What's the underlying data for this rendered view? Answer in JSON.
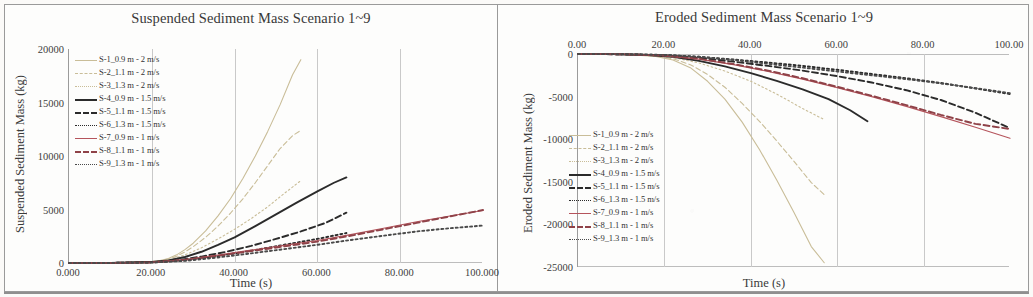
{
  "figure": {
    "panels": [
      "suspended",
      "eroded"
    ]
  },
  "colors": {
    "tan": "#c9bd98",
    "black": "#2b2b2b",
    "red": "#b5545c",
    "grid": "#c9c9c9",
    "axis": "#9b9b9b",
    "text": "#3a3a3a"
  },
  "legend_series": [
    {
      "key": "S-1",
      "label": "S-1_0.9 m - 2 m/s",
      "color": "#c9bd98",
      "style": "solid",
      "weight": "thin"
    },
    {
      "key": "S-2",
      "label": "S-2_1.1 m - 2 m/s",
      "color": "#c9bd98",
      "style": "dash",
      "weight": "thin"
    },
    {
      "key": "S-3",
      "label": "S-3_1.3 m - 2 m/s",
      "color": "#c9bd98",
      "style": "dot",
      "weight": "thin"
    },
    {
      "key": "S-4",
      "label": "S-4_0.9 m - 1.5 m/s",
      "color": "#2b2b2b",
      "style": "solid",
      "weight": "thick"
    },
    {
      "key": "S-5",
      "label": "S-5_1.1 m - 1.5 m/s",
      "color": "#2b2b2b",
      "style": "dash",
      "weight": "thick"
    },
    {
      "key": "S-6",
      "label": "S-6_1.3 m - 1.5 m/s",
      "color": "#2b2b2b",
      "style": "dot",
      "weight": "thick"
    },
    {
      "key": "S-7",
      "label": "S-7_0.9 m - 1 m/s",
      "color": "#b5545c",
      "style": "solid",
      "weight": "thin"
    },
    {
      "key": "S-8",
      "label": "S-8_1.1 m - 1 m/s",
      "color": "#8f4248",
      "style": "dash",
      "weight": "thick"
    },
    {
      "key": "S-9",
      "label": "S-9_1.3 m - 1 m/s",
      "color": "#4a4a4a",
      "style": "dot",
      "weight": "thick"
    }
  ],
  "chart_data": [
    {
      "id": "suspended",
      "type": "line",
      "title": "Suspended Sediment Mass Scenario 1~9",
      "xlabel": "Time (s)",
      "ylabel": "Suspended Sediment Mass (kg)",
      "xlim": [
        0,
        100
      ],
      "ylim": [
        0,
        20000
      ],
      "xticks": [
        0,
        20,
        40,
        60,
        80,
        100
      ],
      "xticklabels": [
        "0.000",
        "20.000",
        "40.000",
        "60.000",
        "80.000",
        "100.000"
      ],
      "yticks": [
        0,
        5000,
        10000,
        15000,
        20000
      ],
      "yticklabels": [
        "0",
        "5000",
        "10000",
        "15000",
        "20000"
      ],
      "grid": "vertical",
      "xaxis_position": "bottom",
      "legend_position": "top-left-inside",
      "series": [
        {
          "name": "S-1_0.9 m - 2 m/s",
          "x": [
            0,
            5,
            10,
            15,
            20,
            22,
            24,
            26,
            28,
            30,
            33,
            36,
            39,
            42,
            45,
            48,
            51,
            54,
            56
          ],
          "y": [
            0,
            10,
            30,
            70,
            140,
            230,
            420,
            760,
            1250,
            1850,
            3000,
            4400,
            6000,
            7900,
            10000,
            12300,
            14800,
            17600,
            19000
          ]
        },
        {
          "name": "S-2_1.1 m - 2 m/s",
          "x": [
            0,
            5,
            10,
            15,
            20,
            22,
            24,
            26,
            28,
            30,
            33,
            36,
            39,
            42,
            45,
            48,
            51,
            54,
            56
          ],
          "y": [
            0,
            8,
            25,
            60,
            120,
            200,
            360,
            640,
            1040,
            1520,
            2400,
            3450,
            4650,
            6000,
            7500,
            9100,
            10700,
            11900,
            12400
          ]
        },
        {
          "name": "S-3_1.3 m - 2 m/s",
          "x": [
            0,
            5,
            10,
            15,
            20,
            24,
            28,
            32,
            36,
            40,
            44,
            48,
            52,
            56
          ],
          "y": [
            0,
            6,
            20,
            48,
            100,
            280,
            760,
            1420,
            2250,
            3150,
            4150,
            5250,
            6500,
            7700
          ]
        },
        {
          "name": "S-4_0.9 m - 1.5 m/s",
          "x": [
            0,
            5,
            10,
            15,
            20,
            24,
            28,
            32,
            36,
            40,
            45,
            50,
            55,
            60,
            64,
            67
          ],
          "y": [
            0,
            5,
            15,
            40,
            90,
            230,
            560,
            1050,
            1700,
            2400,
            3450,
            4550,
            5650,
            6700,
            7500,
            8000
          ]
        },
        {
          "name": "S-5_1.1 m - 1.5 m/s",
          "x": [
            0,
            10,
            20,
            26,
            32,
            38,
            44,
            50,
            56,
            62,
            67
          ],
          "y": [
            0,
            12,
            70,
            240,
            600,
            1050,
            1600,
            2250,
            2950,
            3750,
            4700
          ]
        },
        {
          "name": "S-6_1.3 m - 1.5 m/s",
          "x": [
            0,
            10,
            20,
            28,
            36,
            44,
            52,
            60,
            67
          ],
          "y": [
            0,
            10,
            55,
            250,
            650,
            1150,
            1700,
            2250,
            2800
          ]
        },
        {
          "name": "S-7_0.9 m - 1 m/s",
          "x": [
            0,
            10,
            20,
            28,
            36,
            44,
            52,
            60,
            68,
            76,
            84,
            92,
            100
          ],
          "y": [
            0,
            10,
            60,
            330,
            750,
            1200,
            1650,
            2100,
            2650,
            3250,
            3850,
            4400,
            4900
          ]
        },
        {
          "name": "S-8_1.1 m - 1 m/s",
          "x": [
            0,
            10,
            20,
            28,
            36,
            44,
            52,
            60,
            68,
            76,
            84,
            92,
            100
          ],
          "y": [
            0,
            9,
            55,
            290,
            680,
            1120,
            1550,
            2000,
            2550,
            3150,
            3750,
            4350,
            4950
          ]
        },
        {
          "name": "S-9_1.3 m - 1 m/s",
          "x": [
            0,
            10,
            20,
            28,
            36,
            44,
            52,
            60,
            68,
            76,
            84,
            92,
            100
          ],
          "y": [
            0,
            7,
            40,
            200,
            520,
            900,
            1300,
            1700,
            2150,
            2550,
            2950,
            3250,
            3500
          ]
        }
      ]
    },
    {
      "id": "eroded",
      "type": "line",
      "title": "Eroded Sediment Mass Scenario 1~9",
      "xlabel": "Time (s)",
      "ylabel": "Eroded Sediment Mass (kg)",
      "xlim": [
        0,
        100
      ],
      "ylim": [
        -25000,
        0
      ],
      "xticks": [
        0,
        20,
        40,
        60,
        80,
        100
      ],
      "xticklabels": [
        "0.00",
        "20.00",
        "40.00",
        "60.00",
        "80.00",
        "100.00"
      ],
      "yticks": [
        0,
        -5000,
        -10000,
        -15000,
        -20000,
        -25000
      ],
      "yticklabels": [
        "0",
        "-5000",
        "-10000",
        "-15000",
        "-20000",
        "-25000"
      ],
      "grid": "vertical",
      "xaxis_position": "top",
      "legend_position": "lower-left-inside",
      "series": [
        {
          "name": "S-1_0.9 m - 2 m/s",
          "x": [
            0,
            6,
            12,
            18,
            22,
            26,
            30,
            34,
            38,
            42,
            46,
            50,
            54,
            57
          ],
          "y": [
            0,
            -20,
            -80,
            -300,
            -700,
            -1600,
            -3200,
            -5300,
            -8000,
            -11200,
            -14800,
            -18600,
            -22600,
            -24500
          ]
        },
        {
          "name": "S-2_1.1 m - 2 m/s",
          "x": [
            0,
            6,
            12,
            18,
            22,
            26,
            30,
            34,
            38,
            42,
            46,
            50,
            54,
            57
          ],
          "y": [
            0,
            -15,
            -60,
            -230,
            -560,
            -1250,
            -2400,
            -3900,
            -5800,
            -7900,
            -10200,
            -12600,
            -15100,
            -16500
          ]
        },
        {
          "name": "S-3_1.3 m - 2 m/s",
          "x": [
            0,
            8,
            16,
            22,
            28,
            34,
            40,
            46,
            52,
            57
          ],
          "y": [
            0,
            -25,
            -130,
            -420,
            -1050,
            -2000,
            -3200,
            -4700,
            -6400,
            -7700
          ]
        },
        {
          "name": "S-4_0.9 m - 1.5 m/s",
          "x": [
            0,
            8,
            16,
            22,
            28,
            34,
            40,
            46,
            52,
            58,
            63,
            67
          ],
          "y": [
            0,
            -20,
            -110,
            -330,
            -800,
            -1450,
            -2250,
            -3150,
            -4150,
            -5300,
            -6600,
            -7900
          ]
        },
        {
          "name": "S-5_1.1 m - 1.5 m/s",
          "x": [
            0,
            10,
            20,
            28,
            36,
            44,
            52,
            60,
            68,
            76,
            84,
            92,
            100
          ],
          "y": [
            0,
            -30,
            -150,
            -450,
            -900,
            -1400,
            -1950,
            -2600,
            -3350,
            -4250,
            -5400,
            -6900,
            -8700
          ]
        },
        {
          "name": "S-6_1.3 m - 1.5 m/s",
          "x": [
            0,
            10,
            20,
            28,
            36,
            44,
            52,
            60,
            68,
            76,
            84,
            92,
            100
          ],
          "y": [
            0,
            -25,
            -120,
            -330,
            -650,
            -1000,
            -1400,
            -1850,
            -2350,
            -2850,
            -3400,
            -4050,
            -4700
          ]
        },
        {
          "name": "S-7_0.9 m - 1 m/s",
          "x": [
            0,
            10,
            20,
            28,
            36,
            44,
            52,
            60,
            68,
            76,
            84,
            92,
            100
          ],
          "y": [
            0,
            -35,
            -200,
            -600,
            -1250,
            -2050,
            -2950,
            -3950,
            -5000,
            -6150,
            -7350,
            -8600,
            -9900
          ]
        },
        {
          "name": "S-8_1.1 m - 1 m/s",
          "x": [
            0,
            10,
            20,
            28,
            36,
            44,
            52,
            60,
            68,
            76,
            84,
            92,
            100
          ],
          "y": [
            0,
            -30,
            -180,
            -560,
            -1180,
            -1950,
            -2850,
            -3850,
            -4900,
            -6000,
            -7150,
            -8200,
            -8800
          ]
        },
        {
          "name": "S-9_1.3 m - 1 m/s",
          "x": [
            0,
            10,
            20,
            28,
            36,
            44,
            52,
            60,
            68,
            76,
            84,
            92,
            100
          ],
          "y": [
            0,
            -20,
            -110,
            -330,
            -700,
            -1150,
            -1600,
            -2050,
            -2500,
            -2950,
            -3450,
            -4000,
            -4600
          ]
        }
      ]
    }
  ]
}
